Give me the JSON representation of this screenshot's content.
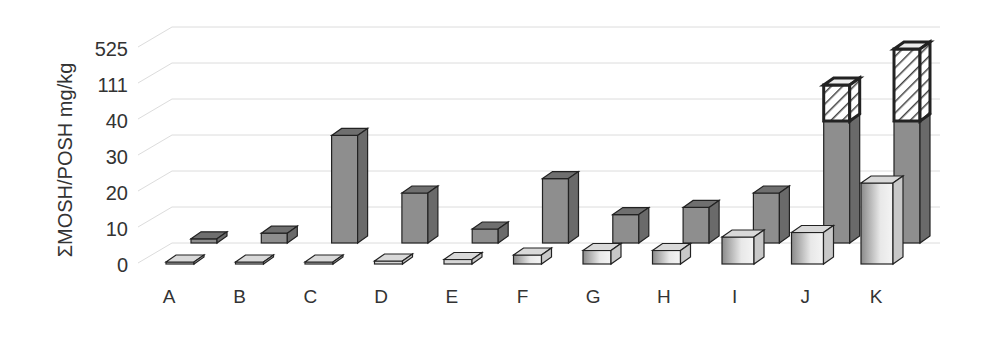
{
  "chart_data": {
    "type": "bar",
    "style": "3d-clustered",
    "title": "",
    "xlabel": "",
    "ylabel": "ΣMOSH/POSH mg/kg",
    "y_ticks": [
      "0",
      "10",
      "20",
      "30",
      "40",
      "111",
      "525"
    ],
    "y_scale": "broken (non-linear) axis",
    "grid": true,
    "legend": null,
    "categories": [
      "A",
      "B",
      "C",
      "D",
      "E",
      "F",
      "G",
      "H",
      "I",
      "J",
      "K"
    ],
    "series": [
      {
        "name": "front-row (light)",
        "color": "#d0d0d0",
        "values": [
          0,
          0,
          0,
          0.5,
          1,
          2,
          3,
          3,
          6,
          7,
          18
        ]
      },
      {
        "name": "back-row (dark)",
        "color": "#8c8c8c",
        "values": [
          3,
          7,
          36,
          20,
          10,
          24,
          14,
          16,
          20,
          40,
          40
        ]
      },
      {
        "name": "back-row hatched extension",
        "color": "#ffffff",
        "pattern": "diagonal-hatch",
        "values": [
          null,
          null,
          null,
          null,
          null,
          null,
          null,
          null,
          null,
          111,
          525
        ]
      }
    ]
  }
}
